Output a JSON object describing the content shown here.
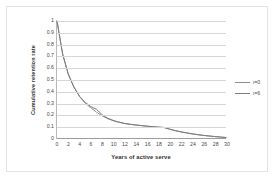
{
  "chart_data": {
    "type": "line",
    "title": "",
    "xlabel": "Years of active serve",
    "ylabel": "Cumulative retention rate",
    "xlim": [
      0,
      30
    ],
    "ylim": [
      0,
      1
    ],
    "grid": "horizontal",
    "legend_position": "right",
    "x_ticks": [
      0,
      2,
      4,
      6,
      8,
      10,
      12,
      14,
      16,
      18,
      20,
      22,
      24,
      26,
      28,
      30
    ],
    "y_ticks": [
      0,
      0.1,
      0.2,
      0.3,
      0.4,
      0.5,
      0.6,
      0.7,
      0.8,
      0.9,
      1
    ],
    "x_tick_labels": [
      "0",
      "2",
      "4",
      "6",
      "8",
      "10",
      "12",
      "14",
      "16",
      "18",
      "20",
      "22",
      "24",
      "26",
      "28",
      "30"
    ],
    "y_tick_labels": [
      "0",
      "0.1",
      "0.2",
      "0.3",
      "0.4",
      "0.5",
      "0.6",
      "0.7",
      "0.8",
      "0.9",
      "1"
    ],
    "x": [
      0,
      1,
      2,
      3,
      4,
      5,
      6,
      7,
      8,
      9,
      10,
      11,
      12,
      13,
      14,
      15,
      16,
      17,
      18,
      19,
      20,
      21,
      22,
      23,
      24,
      25,
      26,
      27,
      28,
      29,
      30
    ],
    "series": [
      {
        "name": "ι=0",
        "color": "#8d8d8d",
        "values": [
          1.0,
          0.72,
          0.55,
          0.44,
          0.36,
          0.305,
          0.265,
          0.228,
          0.196,
          0.172,
          0.155,
          0.142,
          0.131,
          0.124,
          0.118,
          0.113,
          0.108,
          0.104,
          0.1,
          0.097,
          0.083,
          0.07,
          0.06,
          0.051,
          0.043,
          0.036,
          0.03,
          0.025,
          0.02,
          0.016,
          0.012
        ]
      },
      {
        "name": "ι=6",
        "color": "#7d7d7d",
        "values": [
          1.0,
          0.72,
          0.55,
          0.44,
          0.362,
          0.31,
          0.275,
          0.252,
          0.206,
          0.176,
          0.157,
          0.143,
          0.132,
          0.125,
          0.119,
          0.114,
          0.109,
          0.105,
          0.101,
          0.098,
          0.084,
          0.071,
          0.061,
          0.052,
          0.044,
          0.037,
          0.031,
          0.026,
          0.021,
          0.017,
          0.013
        ]
      }
    ]
  },
  "legend": {
    "entries": [
      {
        "label": "ι=0"
      },
      {
        "label": "ι=6"
      }
    ]
  },
  "axes": {
    "x_title": "Years of active serve",
    "y_title": "Cumulative retention rate"
  },
  "colors": {
    "grid": "#d7d7d7",
    "axis": "#9d9d9d",
    "frame": "#e3e3e3",
    "text": "#4a4a4a",
    "background": "#ffffff"
  }
}
